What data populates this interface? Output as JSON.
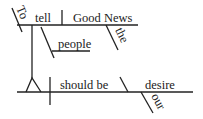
{
  "diagram": {
    "type": "sentence-diagram",
    "words": {
      "to": "To",
      "tell": "tell",
      "good_news": "Good News",
      "the": "the",
      "people": "people",
      "should_be": "should be",
      "desire": "desire",
      "our": "our"
    },
    "colors": {
      "ink": "#222222",
      "background": "#ffffff"
    }
  }
}
